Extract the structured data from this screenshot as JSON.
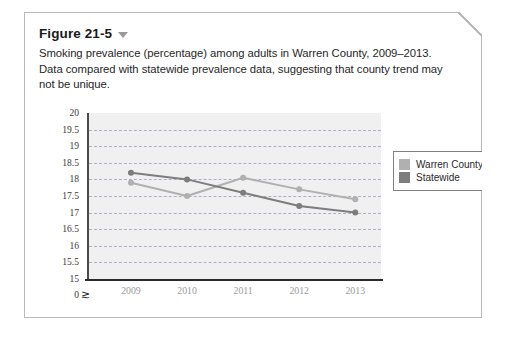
{
  "figure": {
    "title": "Figure 21-5",
    "disclosure_icon": "chevron-down-icon",
    "caption": "Smoking prevalence (percentage) among adults in Warren County, 2009–2013. Data compared with statewide prevalence data, suggesting that county trend may not be unique."
  },
  "colors": {
    "warren_county": "#b0b0b0",
    "statewide": "#7d7d7d",
    "plot_background": "#f0f0f0",
    "gridline": "#a9b2c4",
    "axis": "#2a2a2a",
    "card_border": "#b9b9b9"
  },
  "chart_data": {
    "type": "line",
    "title": "",
    "xlabel": "",
    "ylabel": "",
    "categories": [
      "2009",
      "2010",
      "2011",
      "2012",
      "2013"
    ],
    "x": [
      2009,
      2010,
      2011,
      2012,
      2013
    ],
    "ylim": [
      15,
      20
    ],
    "yticks": [
      "20",
      "19.5",
      "19",
      "18.5",
      "18",
      "17.5",
      "17",
      "16.5",
      "16",
      "15.5",
      "15",
      "0"
    ],
    "ytick_values": [
      20,
      19.5,
      19,
      18.5,
      18,
      17.5,
      17,
      16.5,
      16,
      15.5,
      15
    ],
    "axis_break": true,
    "axis_break_symbol": "⪰",
    "grid": true,
    "grid_axis": "y",
    "legend_position": "right",
    "series": [
      {
        "name": "Warren County",
        "color": "#b0b0b0",
        "values": [
          17.9,
          17.5,
          18.05,
          17.7,
          17.4
        ]
      },
      {
        "name": "Statewide",
        "color": "#7d7d7d",
        "values": [
          18.2,
          18.0,
          17.6,
          17.2,
          17.0
        ]
      }
    ]
  }
}
